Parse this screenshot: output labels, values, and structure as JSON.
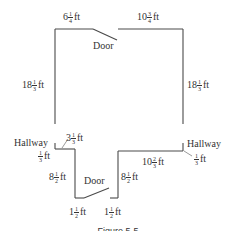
{
  "figure": {
    "caption": "Figure 5-5",
    "labels": {
      "top_left": {
        "whole": "6",
        "num": "1",
        "den": "4",
        "unit": "ft"
      },
      "top_right": {
        "whole": "10",
        "num": "3",
        "den": "4",
        "unit": "ft"
      },
      "door_top": "Door",
      "left_wall": {
        "whole": "18",
        "num": "1",
        "den": "3",
        "unit": "ft"
      },
      "right_wall": {
        "whole": "18",
        "num": "1",
        "den": "3",
        "unit": "ft"
      },
      "hallway_left": "Hallway",
      "hallway_left_offset": {
        "num": "1",
        "den": "3",
        "unit": "ft"
      },
      "hallway_left_segment": {
        "whole": "3",
        "num": "1",
        "den": "3",
        "unit": "ft"
      },
      "hallway_right": "Hallway",
      "hallway_right_offset": {
        "num": "1",
        "den": "3",
        "unit": "ft"
      },
      "bottom_right_segment": {
        "whole": "10",
        "num": "2",
        "den": "3",
        "unit": "ft"
      },
      "alcove_left": {
        "whole": "8",
        "num": "1",
        "den": "2",
        "unit": "ft"
      },
      "alcove_right": {
        "whole": "8",
        "num": "1",
        "den": "2",
        "unit": "ft"
      },
      "door_bottom": "Door",
      "bottom_left": {
        "whole": "1",
        "num": "1",
        "den": "2",
        "unit": "ft"
      },
      "bottom_right": {
        "whole": "1",
        "num": "1",
        "den": "2",
        "unit": "ft"
      }
    }
  }
}
